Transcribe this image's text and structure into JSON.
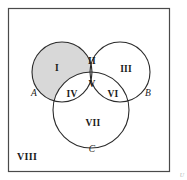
{
  "colors": {
    "shading": "#d8d8d8",
    "stroke": "#2b2b2b",
    "frame": "#4a4a4a",
    "text": "#1a1a1a",
    "background": "#ffffff"
  },
  "sets": [
    {
      "id": "A",
      "label": "A",
      "cx": 62,
      "cy": 72,
      "r": 30,
      "label_x": 34,
      "label_y": 94
    },
    {
      "id": "B",
      "label": "B",
      "cx": 120,
      "cy": 72,
      "r": 30,
      "label_x": 148,
      "label_y": 94
    },
    {
      "id": "C",
      "label": "C",
      "cx": 91,
      "cy": 110,
      "r": 38,
      "label_x": 92,
      "label_y": 150
    }
  ],
  "frame": {
    "x": 8,
    "y": 8,
    "width": 162,
    "height": 164
  },
  "regions": [
    {
      "numeral": "I",
      "name": "region-i",
      "x": 57,
      "y": 69,
      "shaded": true,
      "membership": "A only"
    },
    {
      "numeral": "II",
      "name": "region-ii",
      "x": 92,
      "y": 62,
      "shaded": false,
      "membership": "A and B only"
    },
    {
      "numeral": "III",
      "name": "region-iii",
      "x": 126,
      "y": 70,
      "shaded": false,
      "membership": "B only"
    },
    {
      "numeral": "IV",
      "name": "region-iv",
      "x": 72,
      "y": 95,
      "shaded": false,
      "membership": "A and C only"
    },
    {
      "numeral": "V",
      "name": "region-v",
      "x": 92,
      "y": 85,
      "shaded": false,
      "membership": "A and B and C"
    },
    {
      "numeral": "VI",
      "name": "region-vi",
      "x": 113,
      "y": 95,
      "shaded": false,
      "membership": "B and C only"
    },
    {
      "numeral": "VII",
      "name": "region-vii",
      "x": 93,
      "y": 124,
      "shaded": false,
      "membership": "C only"
    }
  ],
  "universe": {
    "numeral": "VIII",
    "x": 17,
    "y": 158,
    "membership": "outside A, B and C"
  },
  "corner_mark": {
    "text": "U",
    "x": 184,
    "y": 176
  }
}
